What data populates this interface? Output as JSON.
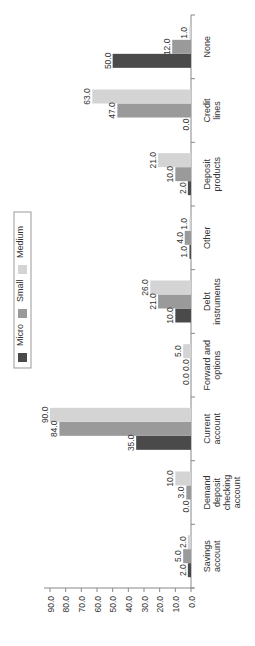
{
  "chart_data": {
    "type": "bar",
    "orientation": "rotated-90-ccw",
    "title": "",
    "xlabel": "",
    "ylabel": "",
    "ylim": [
      0,
      90
    ],
    "yticks": [
      "0.0",
      "10.0",
      "20.0",
      "30.0",
      "40.0",
      "50.0",
      "60.0",
      "70.0",
      "80.0",
      "90.0"
    ],
    "grid": false,
    "legend_position": "top-left (rotated)",
    "categories": [
      "Savings account",
      "Demand deposit checking account",
      "Current account",
      "Forward and options",
      "Debt instruments",
      "Other",
      "Deposit products",
      "Credit lines",
      "None"
    ],
    "category_lines": [
      [
        "Savings",
        "account"
      ],
      [
        "Demand",
        "deposit",
        "checking",
        "account"
      ],
      [
        "Current",
        "account"
      ],
      [
        "Forward and",
        "options"
      ],
      [
        "Debt",
        "instruments"
      ],
      [
        "Other"
      ],
      [
        "Deposit",
        "products"
      ],
      [
        "Credit",
        "lines"
      ],
      [
        "None"
      ]
    ],
    "series": [
      {
        "name": "Micro",
        "color": "#4a4a4a",
        "values": [
          2.0,
          0.0,
          35.0,
          0.0,
          10.0,
          1.0,
          2.0,
          0.0,
          50.0
        ]
      },
      {
        "name": "Small",
        "color": "#9a9a9a",
        "values": [
          5.0,
          3.0,
          84.0,
          0.0,
          21.0,
          4.0,
          10.0,
          47.0,
          12.0
        ]
      },
      {
        "name": "Medium",
        "color": "#d4d4d4",
        "values": [
          2.0,
          10.0,
          90.0,
          5.0,
          26.0,
          1.0,
          21.0,
          63.0,
          1.0
        ]
      }
    ]
  },
  "legend": {
    "items": [
      {
        "label": "Micro",
        "color": "#4a4a4a"
      },
      {
        "label": "Small",
        "color": "#9a9a9a"
      },
      {
        "label": "Medium",
        "color": "#d4d4d4"
      }
    ]
  }
}
